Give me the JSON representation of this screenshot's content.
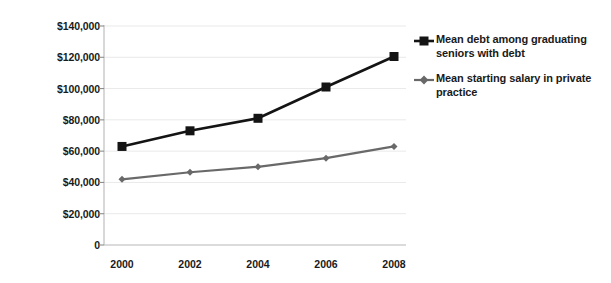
{
  "chart_data": {
    "type": "line",
    "title": "",
    "subtitle": "",
    "xlabel": "",
    "ylabel": "",
    "categories": [
      "2000",
      "2002",
      "2004",
      "2006",
      "2008"
    ],
    "x": [
      2000,
      2002,
      2004,
      2006,
      2008
    ],
    "ylim": [
      0,
      140000
    ],
    "xlim": [
      1999,
      2009
    ],
    "grid": true,
    "grid_axis": "y",
    "legend_position": "right",
    "y_ticks": [
      0,
      20000,
      40000,
      60000,
      80000,
      100000,
      120000,
      140000
    ],
    "y_tick_labels": [
      "0",
      "$20,000",
      "$40,000",
      "$60,000",
      "$80,000",
      "$100,000",
      "$120,000",
      "$140,000"
    ],
    "x_tick_labels": [
      "2000",
      "2002",
      "2004",
      "2006",
      "2008"
    ],
    "series": [
      {
        "name": "Mean debt among graduating seniors with debt",
        "values": [
          63000,
          73000,
          81000,
          101000,
          120500
        ],
        "color": "#141414",
        "marker": "square",
        "marker_size": 9,
        "line_width": 2.6
      },
      {
        "name": "Mean starting salary in private practice",
        "values": [
          42000,
          46500,
          50000,
          55500,
          63000
        ],
        "color": "#696969",
        "marker": "diamond",
        "marker_size": 7,
        "line_width": 2.2
      }
    ],
    "annotations": []
  },
  "legend": {
    "entries": [
      {
        "label": "Mean debt among graduating seniors with debt",
        "marker": "square-line-marker",
        "color": "#141414"
      },
      {
        "label": "Mean starting salary in private practice",
        "marker": "diamond-line-marker",
        "color": "#696969"
      }
    ]
  }
}
